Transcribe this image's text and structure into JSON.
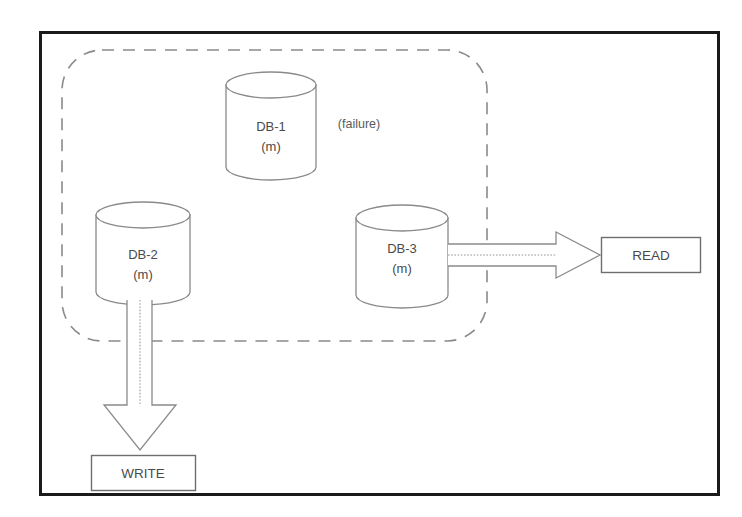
{
  "figure": {
    "background_color": "#ffffff",
    "frame_color": "#1a1a1a",
    "stroke_color": "#6e6e6e",
    "text_color": "#4a4a4a"
  },
  "cluster_boundary": {
    "name": "cluster-boundary",
    "style": "dashed-rounded-rectangle"
  },
  "databases": [
    {
      "id": "db-1",
      "label": "DB-1",
      "sublabel": "(m)",
      "status_note": "(failure)"
    },
    {
      "id": "db-2",
      "label": "DB-2",
      "sublabel": "(m)",
      "status_note": ""
    },
    {
      "id": "db-3",
      "label": "DB-3",
      "sublabel": "(m)",
      "status_note": ""
    }
  ],
  "operations": [
    {
      "id": "read",
      "label": "READ"
    },
    {
      "id": "write",
      "label": "WRITE"
    }
  ],
  "connections": [
    {
      "id": "db3-to-read",
      "from": "DB-3",
      "to": "READ",
      "direction": "right"
    },
    {
      "id": "db2-to-write",
      "from": "DB-2",
      "to": "WRITE",
      "direction": "down"
    }
  ]
}
